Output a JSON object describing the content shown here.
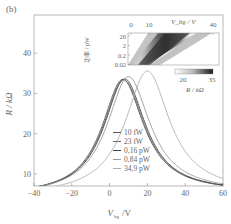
{
  "panel_label": "(b)",
  "chart_data": {
    "type": "line",
    "title": "",
    "xlabel": "V_bg / V",
    "xlabel_main": "V",
    "xlabel_sub": "bg",
    "xlabel_unit": "/V",
    "ylabel": "R / kΩ",
    "xlim": [
      -40,
      60
    ],
    "ylim": [
      7,
      49.5
    ],
    "xticks": [
      -40,
      -20,
      0,
      20,
      40,
      60
    ],
    "xtick_labels": [
      "−40",
      "−20",
      "0",
      "20",
      "40",
      "60"
    ],
    "yticks": [
      10,
      20,
      30,
      40
    ],
    "ytick_labels": [
      "10",
      "20",
      "30",
      "40"
    ],
    "grid": false,
    "legend_position": "center-inside",
    "series": [
      {
        "name": "10 fW",
        "color": "#555555",
        "peak_x": 7,
        "peak_y": 33.5,
        "left_end": 9.6,
        "right_end": 11.0,
        "width": 17
      },
      {
        "name": "23 fW",
        "color": "#6a6a6a",
        "peak_x": 7.5,
        "peak_y": 33.4,
        "left_end": 9.5,
        "right_end": 11.1,
        "width": 17
      },
      {
        "name": "0,16 pW",
        "color": "#444444",
        "peak_x": 8,
        "peak_y": 33.6,
        "left_end": 9.4,
        "right_end": 11.0,
        "width": 17
      },
      {
        "name": "0,84 pW",
        "color": "#9a9a9a",
        "peak_x": 10,
        "peak_y": 34.2,
        "left_end": 9.2,
        "right_end": 11.6,
        "width": 17.5
      },
      {
        "name": "34,9 pW",
        "color": "#b0b0b0",
        "peak_x": 20,
        "peak_y": 35.6,
        "left_end": 8.8,
        "right_end": 14.3,
        "width": 18
      }
    ],
    "inset": {
      "type": "heatmap",
      "xlabel": "V_bg / V",
      "ylabel": "功率 / pW",
      "xticks": [
        0,
        10,
        40
      ],
      "xtick_labels": [
        "0",
        "10",
        "40"
      ],
      "yticks": [
        20,
        2,
        0.2,
        0.02
      ],
      "ytick_labels": [
        "20",
        "2",
        "0.2",
        "0.02"
      ],
      "colorbar": {
        "label": "R / kΩ",
        "ticks": [
          "20",
          "35"
        ],
        "min": 20,
        "max": 35,
        "cmap": "white-to-black"
      }
    }
  }
}
